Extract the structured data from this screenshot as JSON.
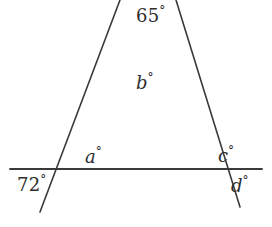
{
  "figure": {
    "stroke_color": "#3a3a3a",
    "background_color": "#ffffff",
    "labels": {
      "apex": {
        "value": "65",
        "unit": "°"
      },
      "interior_b": {
        "value": "b",
        "unit": "°"
      },
      "left_above_a": {
        "value": "a",
        "unit": "°"
      },
      "left_below_72": {
        "value": "72",
        "unit": "°"
      },
      "right_above_c": {
        "value": "c",
        "unit": "°"
      },
      "right_below_d": {
        "value": "d",
        "unit": "°"
      }
    },
    "geometry": {
      "line_left": {
        "name": "left-transversal",
        "x1": 120,
        "y1": 0,
        "x2": 40,
        "y2": 212
      },
      "line_right": {
        "name": "right-transversal",
        "x1": 176,
        "y1": 0,
        "x2": 240,
        "y2": 207
      },
      "line_horizontal": {
        "name": "horizontal-line",
        "x1": 10,
        "y1": 169,
        "x2": 262,
        "y2": 169
      },
      "vertex_apex": {
        "x": 145,
        "y": 52
      },
      "vertex_left": {
        "x": 67,
        "y": 170
      },
      "vertex_right": {
        "x": 218,
        "y": 170
      }
    }
  }
}
